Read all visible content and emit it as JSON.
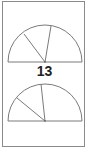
{
  "figure": {
    "label": "13",
    "stroke_color": "#7a7a7a",
    "border_color": "#8a8a8a",
    "semicircles": [
      {
        "name": "top-semicircle",
        "center": [
          45,
          62
        ],
        "radius": 37,
        "radii_endpoints": [
          [
            24,
            34
          ],
          [
            51,
            26
          ]
        ]
      },
      {
        "name": "bottom-semicircle",
        "center": [
          45,
          121
        ],
        "radius": 37,
        "radii_endpoints": [
          [
            17,
            98
          ],
          [
            41,
            84
          ]
        ]
      }
    ]
  }
}
